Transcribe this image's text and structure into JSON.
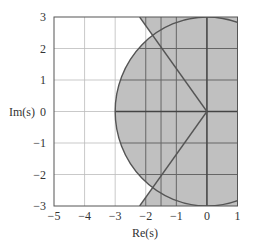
{
  "chart_data": {
    "type": "area",
    "title": "",
    "xlabel": "Re(s)",
    "ylabel": "Im(s)",
    "xlim": [
      -5,
      1
    ],
    "ylim": [
      -3,
      3
    ],
    "xticks": [
      "-5",
      "-4",
      "-3",
      "-2",
      "-1",
      "0",
      "1"
    ],
    "yticks": [
      "3",
      "2",
      "1",
      "0",
      "-1",
      "-2",
      "-3"
    ],
    "x_gridlines": [
      -4,
      -3,
      -2,
      -1.5,
      -1,
      0
    ],
    "y_gridlines": [
      -2,
      -1,
      0,
      1,
      2
    ],
    "grid": true,
    "shaded_region": {
      "description": "Union of disk of radius 3 centered at origin and wedge bounded by lines from origin through (-2.2, 3) and (-2.2, -3), extending right",
      "circle": {
        "center": [
          0,
          0
        ],
        "radius": 3
      },
      "wedge_lines": [
        [
          [
            0,
            0
          ],
          [
            -2.2,
            3
          ]
        ],
        [
          [
            0,
            0
          ],
          [
            -2.2,
            -3
          ]
        ]
      ],
      "fill_color": "#c0c0c0"
    },
    "colors": {
      "fill": "#c0c0c0",
      "boundary": "#555555",
      "grid_light": "#bbbbbb",
      "grid_dark": "#555555"
    }
  },
  "labels": {
    "xlabel": "Re(s)",
    "ylabel": "Im(s)",
    "xticks": [
      "−5",
      "−4",
      "−3",
      "−2",
      "−1",
      "0",
      "1"
    ],
    "yticks": [
      "3",
      "2",
      "1",
      "0",
      "−1",
      "−2",
      "−3"
    ]
  }
}
